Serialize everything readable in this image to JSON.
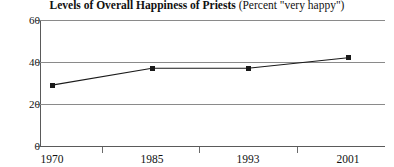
{
  "chart_data": {
    "type": "line",
    "title_main": "Levels of Overall Happiness of Priests",
    "title_sub": "(Percent \"very happy\")",
    "title_full": "Levels of Overall Happiness of Priests (Percent \"very happy\")",
    "categories": [
      "1970",
      "1985",
      "1993",
      "2001"
    ],
    "values": [
      29,
      37,
      37,
      42
    ],
    "series": [
      {
        "name": "Percent \"very happy\"",
        "values": [
          29,
          37,
          37,
          42
        ]
      }
    ],
    "xlabel": "",
    "ylabel": "",
    "ylim": [
      0,
      60
    ],
    "yticks": [
      "0",
      "20",
      "40",
      "60"
    ],
    "ytick_values": [
      0,
      20,
      40,
      60
    ],
    "grid": true,
    "legend": "none",
    "marker": "square",
    "line_color": "#1a1a1a",
    "grid_color": "#8a8a8a",
    "axis_color": "#5a5a5a",
    "text_color": "#111111",
    "background": "#ffffff"
  }
}
